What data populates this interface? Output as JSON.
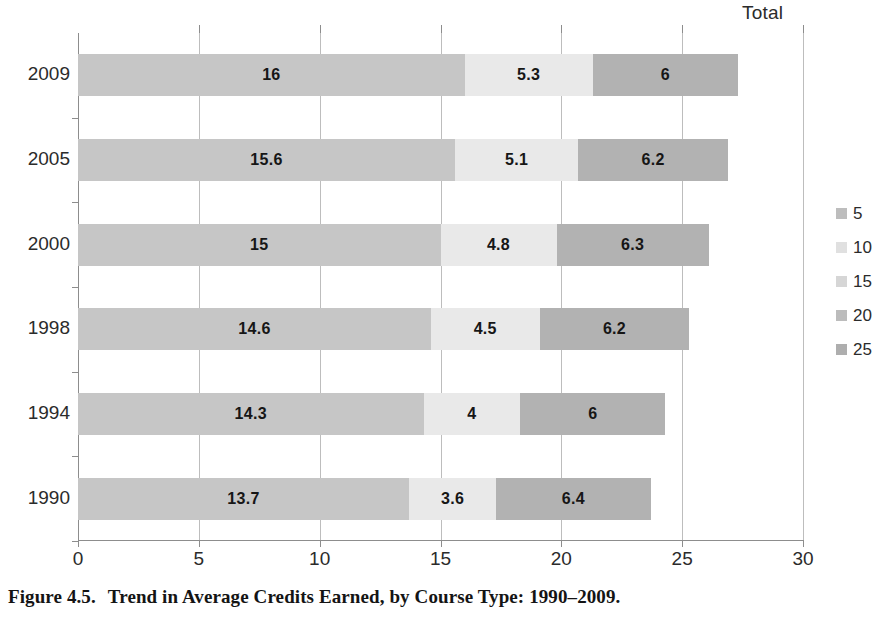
{
  "chart_data": {
    "type": "bar",
    "orientation": "horizontal",
    "stacked": true,
    "title": "",
    "total_header": "Total",
    "xlabel": "",
    "ylabel": "",
    "xlim": [
      0,
      30
    ],
    "xticks": [
      0,
      5,
      10,
      15,
      20,
      25,
      30
    ],
    "xtick_labels": [
      "0",
      "5",
      "10",
      "15",
      "20",
      "25",
      "30"
    ],
    "grid": true,
    "grid_axis": "x",
    "legend_position": "right",
    "categories": [
      "2009",
      "2005",
      "2000",
      "1998",
      "1994",
      "1990"
    ],
    "series": [
      {
        "name": "Core academic",
        "color": "#c6c6c6",
        "values": [
          16,
          15.6,
          15,
          14.6,
          14.3,
          13.7
        ],
        "labels": [
          "16",
          "15.6",
          "15",
          "14.6",
          "14.3",
          "13.7"
        ]
      },
      {
        "name": "Other academic",
        "color": "#e9e9e9",
        "values": [
          5.3,
          5.1,
          4.8,
          4.5,
          4,
          3.6
        ],
        "labels": [
          "5.3",
          "5.1",
          "4.8",
          "4.5",
          "4",
          "3.6"
        ]
      },
      {
        "name": "Career/technical and other",
        "color": "#b2b2b2",
        "values": [
          6,
          6.2,
          6.3,
          6.2,
          6,
          6.4
        ],
        "labels": [
          "6",
          "6.2",
          "6.3",
          "6.2",
          "6",
          "6.4"
        ]
      }
    ],
    "totals": [
      27.3,
      26.9,
      26.1,
      25.3,
      24.3,
      23.7
    ],
    "legend": [
      {
        "label": "5",
        "color": "#bdbdbd"
      },
      {
        "label": "10",
        "color": "#e0e0e0"
      },
      {
        "label": "15",
        "color": "#d6d6d6"
      },
      {
        "label": "20",
        "color": "#bcbcbc"
      },
      {
        "label": "25",
        "color": "#aeaeae"
      }
    ]
  },
  "caption": {
    "figure_number": "Figure 4.5.",
    "text": "Trend in Average Credits Earned, by Course Type: 1990–2009."
  }
}
